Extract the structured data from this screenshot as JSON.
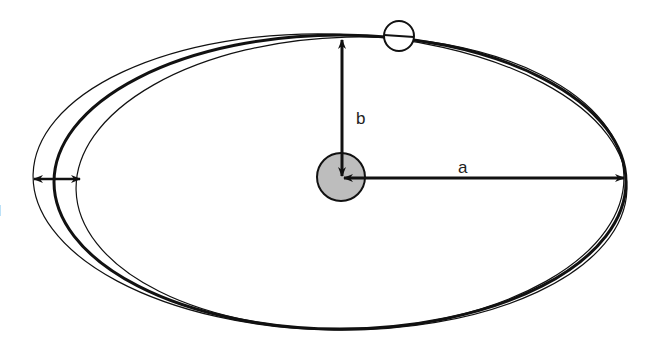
{
  "diagram": {
    "labels": {
      "semi_major_axis": "a",
      "semi_minor_axis": "b",
      "left_edge_fragment": "l"
    },
    "elements": {
      "central_body": "central mass at focus (shaded circle)",
      "orbiting_body": "small hollow circle on orbit",
      "orbits": [
        "inner thin orbit",
        "main thick orbit",
        "outer thin orbit"
      ],
      "arrows": [
        "semi-major axis arrow a",
        "semi-minor axis arrow b",
        "orbit spread double arrow"
      ]
    },
    "colors": {
      "stroke": "#111111",
      "central_body_fill": "#bdbdbd",
      "background": "#ffffff"
    }
  }
}
